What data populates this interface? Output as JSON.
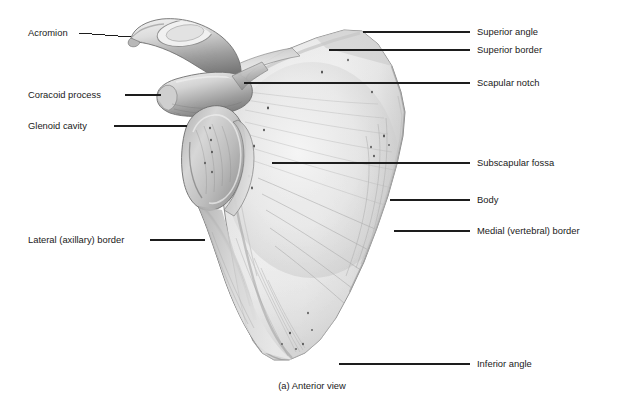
{
  "figure": {
    "caption": "(a) Anterior view",
    "background_color": "#ffffff",
    "label_color": "#1a1a1a",
    "leader_color": "#1d1d1d",
    "bone_fill": "#e9e9e9",
    "bone_shadow": "#9a9a9a",
    "bone_outline": "#6f6f6f"
  },
  "labels_left": [
    {
      "id": "acromion",
      "text": "Acromion"
    },
    {
      "id": "coracoid-process",
      "text": "Coracoid process"
    },
    {
      "id": "glenoid-cavity",
      "text": "Glenoid cavity"
    },
    {
      "id": "lateral-axillary-border",
      "text": "Lateral (axillary) border"
    }
  ],
  "labels_right": [
    {
      "id": "superior-angle",
      "text": "Superior angle"
    },
    {
      "id": "superior-border",
      "text": "Superior border"
    },
    {
      "id": "scapular-notch",
      "text": "Scapular notch"
    },
    {
      "id": "subscapular-fossa",
      "text": "Subscapular fossa"
    },
    {
      "id": "body",
      "text": "Body"
    },
    {
      "id": "medial-vertebral-border",
      "text": "Medial (vertebral) border"
    },
    {
      "id": "inferior-angle",
      "text": "Inferior angle"
    }
  ]
}
